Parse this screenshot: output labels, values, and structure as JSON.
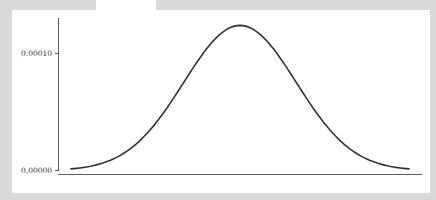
{
  "chart_data": {
    "type": "line",
    "title": "",
    "xlabel": "",
    "ylabel": "",
    "y_ticks": [
      "0.00000",
      "0.00010"
    ],
    "y_tick_values": [
      0.0,
      0.0001
    ],
    "ylim": [
      0.0,
      0.000135
    ],
    "grid": false,
    "legend": null,
    "x_tick_labels_visible": false,
    "series": [
      {
        "name": "density",
        "shape": "normal (bell) curve",
        "x": [
          -3.0,
          -2.5,
          -2.0,
          -1.5,
          -1.0,
          -0.5,
          0.0,
          0.5,
          1.0,
          1.5,
          2.0,
          2.5,
          3.0
        ],
        "x_units": "standard deviations from the mean (x-axis unlabeled)",
        "values": [
          6e-07,
          2.2e-06,
          6.7e-06,
          1.61e-05,
          3.01e-05,
          4.38e-05,
          0.000124,
          4.38e-05,
          3.01e-05,
          1.61e-05,
          6.7e-06,
          2.2e-06,
          6e-07
        ],
        "peak_value": 0.000124
      }
    ],
    "colors": {
      "line": "#333333",
      "axis": "#333333",
      "background": "#ffffff",
      "frame": "#d9d9d9"
    }
  },
  "axis": {
    "y_tick_top": "0.00010",
    "y_tick_bottom": "0.00000"
  }
}
